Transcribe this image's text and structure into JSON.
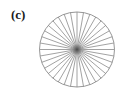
{
  "figure": {
    "panel_label": "(c)",
    "diagram": {
      "type": "radial-spoke-wheel",
      "center": [
        77,
        49.5
      ],
      "radius": 37.5,
      "spoke_count": 36,
      "stroke_color": "#8a8a8a",
      "center_color": "#555555",
      "background": "#ffffff"
    }
  }
}
